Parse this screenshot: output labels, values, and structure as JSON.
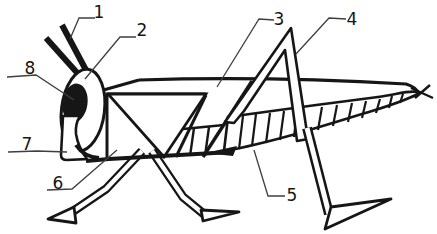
{
  "diagram": {
    "labels": [
      {
        "text": "1"
      },
      {
        "text": "2"
      },
      {
        "text": "3"
      },
      {
        "text": "4"
      },
      {
        "text": "5"
      },
      {
        "text": "6"
      },
      {
        "text": "7"
      },
      {
        "text": "8"
      }
    ]
  },
  "colors": {
    "ink": "#161616",
    "leader": "#3f3f3f",
    "background": "#ffffff"
  }
}
